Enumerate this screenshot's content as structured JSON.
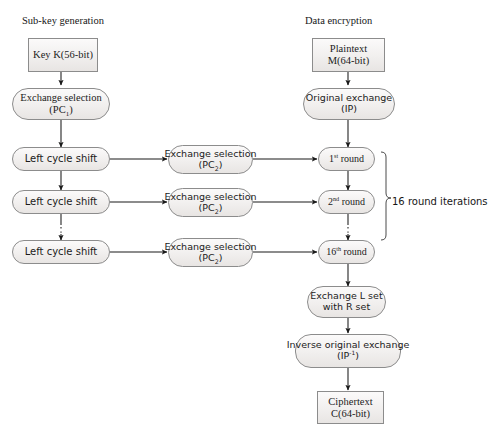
{
  "diagram": {
    "title_left": "Sub-key generation",
    "title_right": "Data encryption",
    "brace_label": "16 round iterations",
    "colors": {
      "node_fill": "#f1efee",
      "node_border": "#8c8c8c",
      "arrow": "#1a1a1a",
      "text": "#1b1b1b",
      "background": "#ffffff"
    },
    "nodes": {
      "key": {
        "line1": "Key K(56-bit)"
      },
      "pc1": {
        "line1": "Exchange selection",
        "line2_pre": "(PC",
        "line2_sub": "1",
        "line2_post": ")"
      },
      "shift1": {
        "line1": "Left cycle shift"
      },
      "shift2": {
        "line1": "Left cycle shift"
      },
      "shift3": {
        "line1": "Left cycle shift"
      },
      "pc2_a": {
        "line1": "Exchange selection",
        "line2_pre": "(PC",
        "line2_sub": "2",
        "line2_post": ")"
      },
      "pc2_b": {
        "line1": "Exchange selection",
        "line2_pre": "(PC",
        "line2_sub": "2",
        "line2_post": ")"
      },
      "pc2_c": {
        "line1": "Exchange selection",
        "line2_pre": "(PC",
        "line2_sub": "2",
        "line2_post": ")"
      },
      "plaintext": {
        "line1": "Plaintext",
        "line2": "M(64-bit)"
      },
      "ip": {
        "line1": "Original exchange",
        "line2": "(IP)"
      },
      "round1": {
        "num": "1",
        "ord": "st",
        "word": "round"
      },
      "round2": {
        "num": "2",
        "ord": "nd",
        "word": "round"
      },
      "round16": {
        "num": "16",
        "ord": "th",
        "word": "round"
      },
      "swap": {
        "line1": "Exchange L set",
        "line2": "with R set"
      },
      "ipinv": {
        "line1": "Inverse original exchange",
        "line2_pre": "(IP",
        "line2_sup": "-1",
        "line2_post": ")"
      },
      "ciphertext": {
        "line1": "Ciphertext",
        "line2": "C(64-bit)"
      }
    }
  }
}
